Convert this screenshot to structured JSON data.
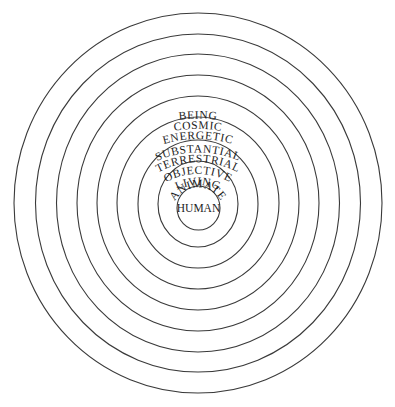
{
  "diagram": {
    "type": "concentric-circles",
    "center_label": "HUMAN",
    "rings_outer_to_inner": [
      {
        "label": "BEING"
      },
      {
        "label": "COSMIC"
      },
      {
        "label": "ENERGETIC"
      },
      {
        "label": "SUBSTANTIAL"
      },
      {
        "label": "TERRESTRIAL"
      },
      {
        "label": "OBJECTIVE"
      },
      {
        "label": "LIVING"
      },
      {
        "label": "ANIMATE"
      }
    ],
    "line_color": "#3a3a3a",
    "text_color": "#1c1c1c",
    "background": "#ffffff"
  }
}
